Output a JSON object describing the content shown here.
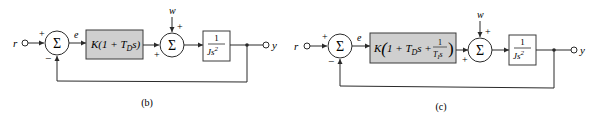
{
  "diagrams": [
    {
      "label": "(b)",
      "input": "r",
      "output": "y",
      "error": "e",
      "disturbance": "w",
      "sum1_symbol": "Σ",
      "sum1_signs": {
        "top": "+",
        "bottom": "−"
      },
      "sum2_symbol": "Σ",
      "sum2_signs": {
        "top": "+",
        "left": "+"
      },
      "controller": {
        "prefix": "K(1 + T",
        "sub": "D",
        "suffix": "s)"
      },
      "plant": {
        "num": "1",
        "den": "Js",
        "den_exp": "2"
      }
    },
    {
      "label": "(c)",
      "input": "r",
      "output": "y",
      "error": "e",
      "disturbance": "w",
      "sum1_symbol": "Σ",
      "sum1_signs": {
        "top": "+",
        "bottom": "−"
      },
      "sum2_symbol": "Σ",
      "sum2_signs": {
        "top": "+",
        "left": "+"
      },
      "controller": {
        "prefix": "K",
        "open": "(",
        "one": "1 + T",
        "sub_d": "D",
        "mid": "s + ",
        "frac_num": "1",
        "frac_den": "T",
        "sub_i": "I",
        "frac_den_s": "s",
        "close": ")"
      },
      "plant": {
        "num": "1",
        "den": "Js",
        "den_exp": "2"
      }
    }
  ],
  "colors": {
    "block_fill": "#cfcfcf",
    "stroke": "#2a2a2a",
    "background": "#ffffff"
  }
}
